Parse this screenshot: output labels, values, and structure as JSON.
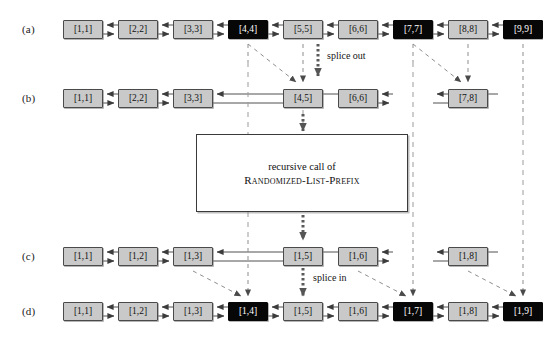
{
  "figure": {
    "background_color": "#ffffff",
    "gray_fill": "#c9c9c9",
    "black_fill": "#070707",
    "line_color": "#4a4a4a",
    "dashed_color": "#8a8a8a"
  },
  "row_labels": {
    "a": "(a)",
    "b": "(b)",
    "c": "(c)",
    "d": "(d)"
  },
  "annotations": {
    "splice_out": "splice out",
    "splice_in": "splice in"
  },
  "recursive_box": {
    "line1": "recursive call of",
    "line2": "Randomized-List-Prefix"
  },
  "rows": {
    "a": {
      "label": "(a)",
      "nodes": [
        {
          "text": "[1,1]",
          "slot": 1,
          "fill": "gray"
        },
        {
          "text": "[2,2]",
          "slot": 2,
          "fill": "gray"
        },
        {
          "text": "[3,3]",
          "slot": 3,
          "fill": "gray"
        },
        {
          "text": "[4,4]",
          "slot": 4,
          "fill": "black"
        },
        {
          "text": "[5,5]",
          "slot": 5,
          "fill": "gray"
        },
        {
          "text": "[6,6]",
          "slot": 6,
          "fill": "gray"
        },
        {
          "text": "[7,7]",
          "slot": 7,
          "fill": "black"
        },
        {
          "text": "[8,8]",
          "slot": 8,
          "fill": "gray"
        },
        {
          "text": "[9,9]",
          "slot": 9,
          "fill": "black"
        }
      ]
    },
    "b": {
      "label": "(b)",
      "nodes": [
        {
          "text": "[1,1]",
          "slot": 1,
          "fill": "gray"
        },
        {
          "text": "[2,2]",
          "slot": 2,
          "fill": "gray"
        },
        {
          "text": "[3,3]",
          "slot": 3,
          "fill": "gray"
        },
        {
          "text": "[4,5]",
          "slot": 5,
          "fill": "gray"
        },
        {
          "text": "[6,6]",
          "slot": 6,
          "fill": "gray"
        },
        {
          "text": "[7,8]",
          "slot": 8,
          "fill": "gray"
        }
      ]
    },
    "c": {
      "label": "(c)",
      "nodes": [
        {
          "text": "[1,1]",
          "slot": 1,
          "fill": "gray"
        },
        {
          "text": "[1,2]",
          "slot": 2,
          "fill": "gray"
        },
        {
          "text": "[1,3]",
          "slot": 3,
          "fill": "gray"
        },
        {
          "text": "[1,5]",
          "slot": 5,
          "fill": "gray"
        },
        {
          "text": "[1,6]",
          "slot": 6,
          "fill": "gray"
        },
        {
          "text": "[1,8]",
          "slot": 8,
          "fill": "gray"
        }
      ]
    },
    "d": {
      "label": "(d)",
      "nodes": [
        {
          "text": "[1,1]",
          "slot": 1,
          "fill": "gray"
        },
        {
          "text": "[1,2]",
          "slot": 2,
          "fill": "gray"
        },
        {
          "text": "[1,3]",
          "slot": 3,
          "fill": "gray"
        },
        {
          "text": "[1,4]",
          "slot": 4,
          "fill": "black"
        },
        {
          "text": "[1,5]",
          "slot": 5,
          "fill": "gray"
        },
        {
          "text": "[1,6]",
          "slot": 6,
          "fill": "gray"
        },
        {
          "text": "[1,7]",
          "slot": 7,
          "fill": "black"
        },
        {
          "text": "[1,8]",
          "slot": 8,
          "fill": "gray"
        },
        {
          "text": "[1,9]",
          "slot": 9,
          "fill": "black"
        }
      ]
    }
  }
}
